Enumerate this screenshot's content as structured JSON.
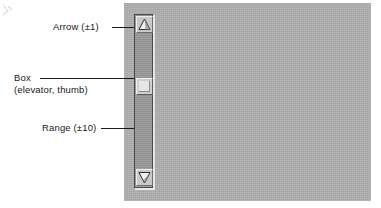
{
  "figure": {
    "type": "annotated-diagram",
    "panel_color": "#b0b0b0",
    "ink_color": "#1a1a1a"
  },
  "annotations": [
    {
      "id": "arrow",
      "label": "Arrow (±1)",
      "target": "scroll-arrow-up-button",
      "leader": true
    },
    {
      "id": "box",
      "label": "Box",
      "sublabel": "(elevator, thumb)",
      "target": "scrollbar-thumb",
      "leader": true
    },
    {
      "id": "range",
      "label": "Range (±10)",
      "target": "scrollbar-trough",
      "leader": true
    }
  ],
  "scrollbar": {
    "orientation": "vertical",
    "trough_color": "#9a9a9a",
    "button_color": "#c9c9c9",
    "thumb_color": "#cfcfcf",
    "arrow_up_icon": "triangle-up-icon",
    "arrow_down_icon": "triangle-down-icon"
  }
}
